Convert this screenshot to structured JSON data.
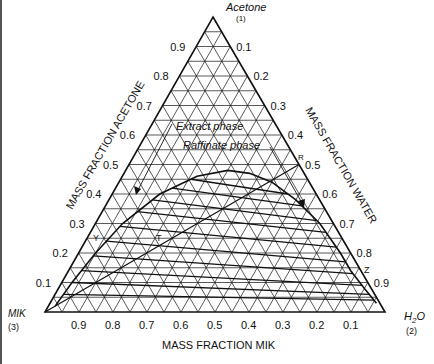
{
  "diagram": {
    "type": "ternary",
    "vertices": {
      "top": {
        "name": "Acetone",
        "index": "(1)"
      },
      "right": {
        "name": "H2O",
        "index": "(2)"
      },
      "left": {
        "name": "MIK",
        "index": "(3)"
      }
    },
    "axis_titles": {
      "left": "MASS FRACTION ACETONE",
      "right": "MASS FRACTION WATER",
      "bottom": "MASS FRACTION MIK"
    },
    "left_ticks": [
      "0.9",
      "0.8",
      "0.7",
      "0.6",
      "0.5",
      "0.4",
      "0.3",
      "0.2",
      "0.1"
    ],
    "right_ticks": [
      "0.1",
      "0.2",
      "0.3",
      "0.4",
      "0.5",
      "0.6",
      "0.7",
      "0.8",
      "0.9"
    ],
    "bottom_ticks": [
      "0.9",
      "0.8",
      "0.7",
      "0.6",
      "0.5",
      "0.4",
      "0.3",
      "0.2",
      "0.1"
    ],
    "annotations": {
      "extract": "Extract phase",
      "raffinate": "Raffinate phase",
      "point_r": "R",
      "point_t": "T",
      "point_y": "Y",
      "point_z": "Z"
    },
    "grid_step": 0.05
  },
  "chart_data": {
    "type": "ternary",
    "title": "",
    "components": [
      "Acetone (1)",
      "H2O (2)",
      "MIK (3)"
    ],
    "axis_labels": {
      "acetone": "MASS FRACTION ACETONE",
      "water": "MASS FRACTION WATER",
      "mik": "MASS FRACTION MIK"
    },
    "ticks": [
      0.1,
      0.2,
      0.3,
      0.4,
      0.5,
      0.6,
      0.7,
      0.8,
      0.9
    ],
    "binodal_curve_acetone_water": [
      [
        0.02,
        0.02
      ],
      [
        0.1,
        0.03
      ],
      [
        0.2,
        0.05
      ],
      [
        0.3,
        0.08
      ],
      [
        0.4,
        0.14
      ],
      [
        0.46,
        0.22
      ],
      [
        0.48,
        0.3
      ],
      [
        0.47,
        0.37
      ],
      [
        0.44,
        0.45
      ],
      [
        0.38,
        0.55
      ],
      [
        0.3,
        0.66
      ],
      [
        0.2,
        0.77
      ],
      [
        0.14,
        0.83
      ],
      [
        0.08,
        0.9
      ],
      [
        0.03,
        0.96
      ]
    ],
    "tie_lines_acetone": [
      {
        "extract": 0.45,
        "raffinate": 0.4
      },
      {
        "extract": 0.42,
        "raffinate": 0.36
      },
      {
        "extract": 0.38,
        "raffinate": 0.31
      },
      {
        "extract": 0.34,
        "raffinate": 0.27
      },
      {
        "extract": 0.29,
        "raffinate": 0.22
      },
      {
        "extract": 0.24,
        "raffinate": 0.17
      },
      {
        "extract": 0.19,
        "raffinate": 0.13
      },
      {
        "extract": 0.14,
        "raffinate": 0.09
      },
      {
        "extract": 0.1,
        "raffinate": 0.06
      },
      {
        "extract": 0.06,
        "raffinate": 0.04
      }
    ],
    "operating_line": {
      "from": "MIK corner",
      "to": "R",
      "R": {
        "acetone": 0.5,
        "water": 0.5,
        "mik": 0.0
      }
    },
    "points": {
      "Y": {
        "acetone": 0.27
      },
      "T": {
        "acetone": 0.27
      },
      "Z": {
        "acetone": 0.14
      },
      "R": {
        "acetone": 0.5
      }
    },
    "annotations": [
      "Extract phase",
      "Raffinate phase",
      "R",
      "T",
      "Y",
      "Z"
    ]
  }
}
